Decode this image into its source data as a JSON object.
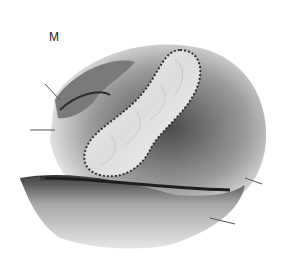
{
  "figure": {
    "label": "M",
    "colors": {
      "background": "#ffffff",
      "ink_dark": "#1e1e1e",
      "tissue_mid": "#8a8a8a",
      "tissue_light": "#e8e8e8"
    }
  }
}
